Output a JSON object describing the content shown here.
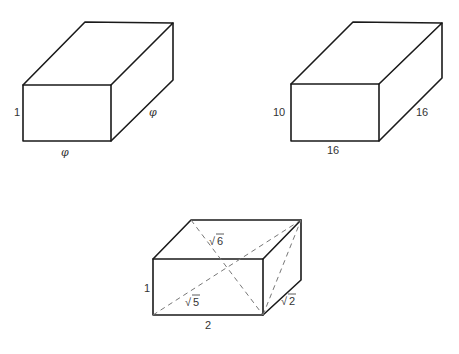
{
  "figures": [
    {
      "name": "golden-box",
      "labels": {
        "height": "1",
        "width": "φ",
        "depth": "φ"
      }
    },
    {
      "name": "box-10-16-16",
      "labels": {
        "height": "10",
        "width": "16",
        "depth": "16"
      }
    },
    {
      "name": "box-1-2-1-diagonals",
      "labels": {
        "height": "1",
        "width": "2",
        "front_diagonal": "√5",
        "side_diagonal": "√2",
        "space_diagonal": "√6",
        "front_diagonal_radicand": "5",
        "side_diagonal_radicand": "2",
        "space_diagonal_radicand": "6",
        "radical": "√"
      }
    }
  ]
}
